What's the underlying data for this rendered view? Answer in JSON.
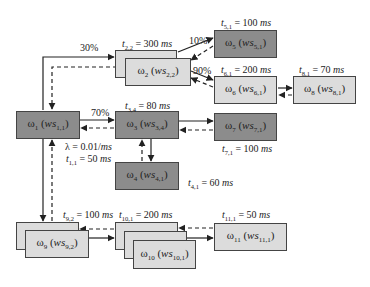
{
  "diagram": {
    "nodes": [
      {
        "id": "w1",
        "label": "ω",
        "sub": "1",
        "ws": "ws",
        "wssub": "1,1",
        "style": "dark"
      },
      {
        "id": "w2",
        "label": "ω",
        "sub": "2",
        "ws": "ws",
        "wssub": "2,2",
        "style": "light",
        "stacked": 2
      },
      {
        "id": "w3",
        "label": "ω",
        "sub": "3",
        "ws": "ws",
        "wssub": "3,4",
        "style": "dark"
      },
      {
        "id": "w4",
        "label": "ω",
        "sub": "4",
        "ws": "ws",
        "wssub": "4,1",
        "style": "dark"
      },
      {
        "id": "w5",
        "label": "ω",
        "sub": "5",
        "ws": "ws",
        "wssub": "5,1",
        "style": "dark"
      },
      {
        "id": "w6",
        "label": "ω",
        "sub": "6",
        "ws": "ws",
        "wssub": "6,1",
        "style": "light"
      },
      {
        "id": "w7",
        "label": "ω",
        "sub": "7",
        "ws": "ws",
        "wssub": "7,1",
        "style": "dark"
      },
      {
        "id": "w8",
        "label": "ω",
        "sub": "8",
        "ws": "ws",
        "wssub": "8,1",
        "style": "light"
      },
      {
        "id": "w9",
        "label": "ω",
        "sub": "9",
        "ws": "ws",
        "wssub": "9,2",
        "style": "light",
        "stacked": 2
      },
      {
        "id": "w10",
        "label": "ω",
        "sub": "10",
        "ws": "ws",
        "wssub": "10,1",
        "style": "light",
        "stacked": 3
      },
      {
        "id": "w11",
        "label": "ω",
        "sub": "11",
        "ws": "ws",
        "wssub": "11,1",
        "style": "light"
      }
    ],
    "times": {
      "t11": {
        "t": "t",
        "sub": "1,1",
        "val": " = 50 ",
        "unit": "ms"
      },
      "t22": {
        "t": "t",
        "sub": "2,2",
        "val": " = 300 ",
        "unit": "ms"
      },
      "t34": {
        "t": "t",
        "sub": "3,4",
        "val": " = 80 ",
        "unit": "ms"
      },
      "t41": {
        "t": "t",
        "sub": "4,1",
        "val": " = 60 ",
        "unit": "ms"
      },
      "t51": {
        "t": "t",
        "sub": "5,1",
        "val": " = 100 ",
        "unit": "ms"
      },
      "t61": {
        "t": "t",
        "sub": "6,1",
        "val": " = 200 ",
        "unit": "ms"
      },
      "t71": {
        "t": "t",
        "sub": "7,1",
        "val": " = 100 ",
        "unit": "ms"
      },
      "t81": {
        "t": "t",
        "sub": "8,1",
        "val": " = 70 ",
        "unit": "ms"
      },
      "t92": {
        "t": "t",
        "sub": "9,2",
        "val": " = 100 ",
        "unit": "ms"
      },
      "t101": {
        "t": "t",
        "sub": "10,1",
        "val": " = 200 ",
        "unit": "ms"
      },
      "t111": {
        "t": "t",
        "sub": "11,1",
        "val": " = 50 ",
        "unit": "ms"
      }
    },
    "lambda": {
      "sym": "λ = 0.01/",
      "unit": "ms"
    },
    "probabilities": {
      "p12": "30%",
      "p13": "70%",
      "p25": "10%",
      "p26": "90%"
    },
    "colors": {
      "dark": "#8c8c8c",
      "light": "#dcdcdc",
      "stroke": "#222222"
    }
  }
}
